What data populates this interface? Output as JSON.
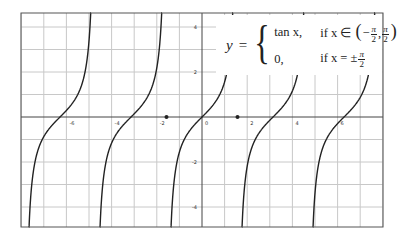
{
  "chart_data": {
    "type": "line",
    "title": "",
    "xlabel": "",
    "ylabel": "",
    "xlim": [
      -8.0,
      8.0
    ],
    "ylim": [
      -4.9,
      4.6
    ],
    "grid": true,
    "legend_position": "none",
    "x_ticks": [
      -6,
      -4,
      -2,
      0,
      2,
      4,
      6
    ],
    "x_tick_labels": [
      "-6",
      "-4",
      "-2",
      "0",
      "2",
      "4",
      "6"
    ],
    "y_ticks": [
      -4,
      -2,
      2,
      4
    ],
    "y_tick_labels": [
      "-4",
      "-2",
      "2",
      "4"
    ],
    "series": [
      {
        "name": "y = tan x (branches)",
        "function": "tan(x)",
        "style": "solid",
        "color": "#222222",
        "branches": [
          {
            "center": -6.2832,
            "x_range": [
              -7.854,
              -4.712
            ]
          },
          {
            "center": -3.1416,
            "x_range": [
              -4.712,
              -1.5708
            ]
          },
          {
            "center": 0,
            "x_range": [
              -1.5708,
              1.5708
            ]
          },
          {
            "center": 3.1416,
            "x_range": [
              1.5708,
              4.712
            ]
          },
          {
            "center": 6.2832,
            "x_range": [
              4.712,
              7.854
            ]
          }
        ]
      },
      {
        "name": "defined points",
        "type": "scatter",
        "color": "#222222",
        "points": [
          {
            "x": -1.5708,
            "y": 0
          },
          {
            "x": 1.5708,
            "y": 0
          }
        ]
      }
    ],
    "annotations": [
      {
        "type": "formula",
        "position": "top-right",
        "text": "y = { tan x, if x ∈ (−π/2, π/2); 0, if x = ±π/2 }"
      }
    ]
  },
  "formula": {
    "lhs": "y",
    "eq": "=",
    "brace": "{",
    "case1_expr": "tan x,",
    "case1_cond_prefix": "if x ∈",
    "case2_expr": "0,",
    "case2_cond_prefix": "if x = ±",
    "pi": "π",
    "two": "2",
    "minus": "−",
    "comma": ",",
    "lparen": "(",
    "rparen": ")"
  },
  "colors": {
    "curve": "#222222",
    "axis": "#444444",
    "grid": "#c8c8c8",
    "frame": "#555555",
    "background": "#ffffff"
  }
}
